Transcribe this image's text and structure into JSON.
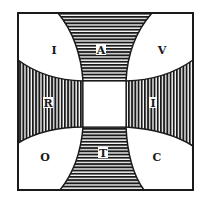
{
  "diagram": {
    "colors": {
      "ink": "#1a1a1a",
      "paper": "#ffffff"
    },
    "regions": {
      "top_left": {
        "letter": "I",
        "fill": "white"
      },
      "top": {
        "letter": "A",
        "fill": "horizontal-hatch"
      },
      "top_right": {
        "letter": "V",
        "fill": "white"
      },
      "left": {
        "letter": "R",
        "fill": "vertical-hatch"
      },
      "center": {
        "letter": "",
        "fill": "white"
      },
      "right": {
        "letter": "I",
        "fill": "vertical-hatch"
      },
      "bottom_left": {
        "letter": "O",
        "fill": "white"
      },
      "bottom": {
        "letter": "T",
        "fill": "horizontal-hatch"
      },
      "bottom_right": {
        "letter": "C",
        "fill": "white"
      }
    }
  }
}
